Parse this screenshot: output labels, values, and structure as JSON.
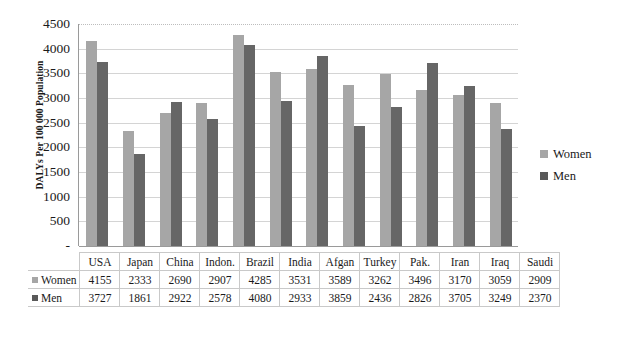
{
  "chart_data": {
    "type": "bar",
    "title": "",
    "xlabel": "",
    "ylabel": "DALYs Per 100 000 Population",
    "ylim": [
      0,
      4500
    ],
    "yticks": [
      "-",
      "500",
      "1000",
      "1500",
      "2000",
      "2500",
      "3000",
      "3500",
      "4000",
      "4500"
    ],
    "ytick_values": [
      0,
      500,
      1000,
      1500,
      2000,
      2500,
      3000,
      3500,
      4000,
      4500
    ],
    "grid": true,
    "legend_position": "right",
    "categories": [
      "USA",
      "Japan",
      "China",
      "Indon.",
      "Brazil",
      "India",
      "Afgan",
      "Turkey",
      "Pak.",
      "Iran",
      "Iraq",
      "Saudi"
    ],
    "series": [
      {
        "name": "Women",
        "color": "#a6a6a6",
        "values": [
          4155,
          2333,
          2690,
          2907,
          4285,
          3531,
          3589,
          3262,
          3496,
          3170,
          3059,
          2909
        ]
      },
      {
        "name": "Men",
        "color": "#666666",
        "values": [
          3727,
          1861,
          2922,
          2578,
          4080,
          2933,
          3859,
          2436,
          2826,
          3705,
          3249,
          2370
        ]
      }
    ]
  },
  "legend": {
    "entries": [
      {
        "label": "Women",
        "color": "#a6a6a6"
      },
      {
        "label": "Men",
        "color": "#595959"
      }
    ]
  },
  "data_table": {
    "corner": "",
    "columns": [
      "USA",
      "Japan",
      "China",
      "Indon.",
      "Brazil",
      "India",
      "Afgan",
      "Turkey",
      "Pak.",
      "Iran",
      "Iraq",
      "Saudi"
    ],
    "rows": [
      {
        "label": "Women",
        "color": "#a6a6a6",
        "cells": [
          "4155",
          "2333",
          "2690",
          "2907",
          "4285",
          "3531",
          "3589",
          "3262",
          "3496",
          "3170",
          "3059",
          "2909"
        ]
      },
      {
        "label": "Men",
        "color": "#595959",
        "cells": [
          "3727",
          "1861",
          "2922",
          "2578",
          "4080",
          "2933",
          "3859",
          "2436",
          "2826",
          "3705",
          "3249",
          "2370"
        ]
      }
    ]
  }
}
